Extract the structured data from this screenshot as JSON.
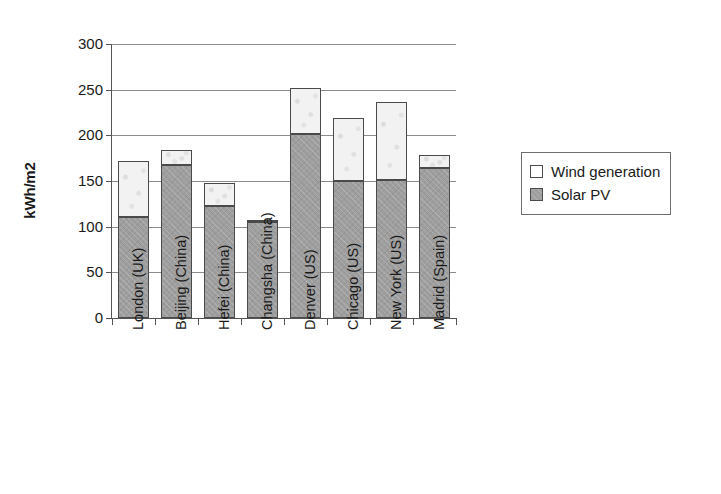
{
  "chart_data": {
    "type": "bar",
    "subtype": "stacked-bar",
    "title": "",
    "xlabel": "",
    "ylabel": "kWh/m2",
    "ylim": [
      0,
      300
    ],
    "ytick_values": [
      0,
      50,
      100,
      150,
      200,
      250,
      300
    ],
    "ytick_labels": [
      "0",
      "50",
      "100",
      "150",
      "200",
      "250",
      "300"
    ],
    "grid": true,
    "grid_axis": "y",
    "legend_position": "right",
    "stack_order": [
      "Solar PV",
      "Wind generation"
    ],
    "categories": [
      "London (UK)",
      "Beijing (China)",
      "Hefei (China)",
      "Changsha (China)",
      "Denver (US)",
      "Chicago (US)",
      "New York (US)",
      "Madrid (Spain)"
    ],
    "series": [
      {
        "name": "Solar PV",
        "color": "#9e9e9e",
        "values": [
          111,
          167,
          123,
          105,
          201,
          150,
          151,
          164
        ]
      },
      {
        "name": "Wind generation",
        "color": "#f2f2f2",
        "values": [
          61,
          17,
          25,
          2,
          51,
          69,
          86,
          15
        ]
      }
    ],
    "totals": [
      172,
      184,
      148,
      107,
      252,
      219,
      237,
      179
    ]
  },
  "legend": {
    "entries": [
      {
        "label": "Wind generation",
        "swatch": "open-square"
      },
      {
        "label": "Solar PV",
        "swatch": "filled-square"
      }
    ]
  },
  "colors": {
    "solar_fill": "#9e9e9e",
    "wind_fill": "#f2f2f2",
    "bar_outline": "#4a4a4a",
    "axis": "#555555",
    "gridline": "#8c8c8c",
    "text": "#1a1a1a",
    "background": "#ffffff"
  }
}
